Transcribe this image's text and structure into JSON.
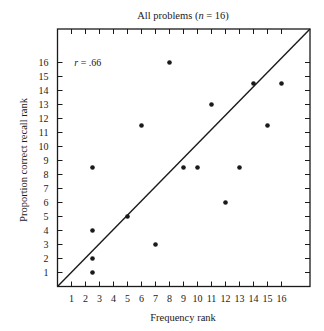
{
  "chart_data": {
    "type": "scatter",
    "title": "All problems (n = 16)",
    "title_parts": {
      "prefix": "All problems (",
      "italic": "n",
      "suffix": " = 16)"
    },
    "xlabel": "Frequency rank",
    "ylabel": "Proportion correct recall rank",
    "xlim": [
      0,
      18
    ],
    "ylim": [
      0,
      18.3
    ],
    "x_ticks": [
      1,
      2,
      3,
      4,
      5,
      6,
      7,
      8,
      9,
      10,
      11,
      12,
      13,
      14,
      15,
      16
    ],
    "y_ticks": [
      1,
      2,
      3,
      4,
      5,
      6,
      7,
      8,
      9,
      10,
      11,
      12,
      13,
      14,
      15,
      16
    ],
    "grid": false,
    "legend": null,
    "annotation": {
      "italic": "r",
      "text": " = .66",
      "x": 1.2,
      "y": 16
    },
    "reference_line": {
      "from": [
        0,
        0
      ],
      "to": [
        18,
        18.3
      ],
      "description": "diagonal identity line"
    },
    "points": [
      {
        "x": 2.5,
        "y": 1
      },
      {
        "x": 2.5,
        "y": 2
      },
      {
        "x": 2.5,
        "y": 4
      },
      {
        "x": 2.5,
        "y": 8.5
      },
      {
        "x": 5,
        "y": 5
      },
      {
        "x": 6,
        "y": 11.5
      },
      {
        "x": 7,
        "y": 3
      },
      {
        "x": 8,
        "y": 16
      },
      {
        "x": 9,
        "y": 8.5
      },
      {
        "x": 10,
        "y": 8.5
      },
      {
        "x": 11,
        "y": 13
      },
      {
        "x": 12,
        "y": 6
      },
      {
        "x": 13,
        "y": 8.5
      },
      {
        "x": 14,
        "y": 14.5
      },
      {
        "x": 15,
        "y": 11.5
      },
      {
        "x": 16,
        "y": 14.5
      }
    ],
    "colors": {
      "ink": "#1a1a1a",
      "background": "#ffffff"
    }
  }
}
